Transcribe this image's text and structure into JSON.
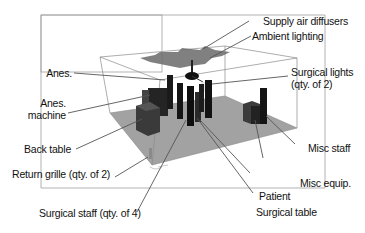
{
  "figure": {
    "colors": {
      "outer_frame": "#9a9a9a",
      "room_edges": "#8a8a8a",
      "floor": "#9e9e9e",
      "objects_dark": "#1a1a1a",
      "objects_mid": "#3a3a3a",
      "leader_lines": "#555555",
      "label_text": "#111111"
    }
  },
  "labels": {
    "supply_air_diffusers": "Supply air diffusers",
    "ambient_lighting": "Ambient lighting",
    "surgical_lights_line1": "Surgical lights",
    "surgical_lights_line2": "(qty. of 2)",
    "anes": "Anes.",
    "anes_machine_line1": "Anes.",
    "anes_machine_line2": "machine",
    "back_table": "Back table",
    "return_grille": "Return grille (qty. of 2)",
    "misc_staff": "Misc staff",
    "misc_equip": "Misc equip.",
    "patient": "Patient",
    "surgical_table": "Surgical table",
    "surgical_staff": "Surgical staff (qty. of 4)"
  }
}
